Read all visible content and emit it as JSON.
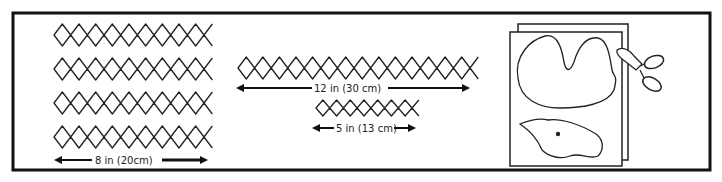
{
  "figure": {
    "panel_left": {
      "strips": 4,
      "measure_label": "8 in (20cm)"
    },
    "panel_middle": {
      "long_strip_label": "12 in (30 cm)",
      "short_strip_label": "5 in (13 cm)"
    },
    "panel_right": {
      "description": "stack of paper sheets with camel-hump and animal-head outlines being cut with scissors"
    }
  }
}
